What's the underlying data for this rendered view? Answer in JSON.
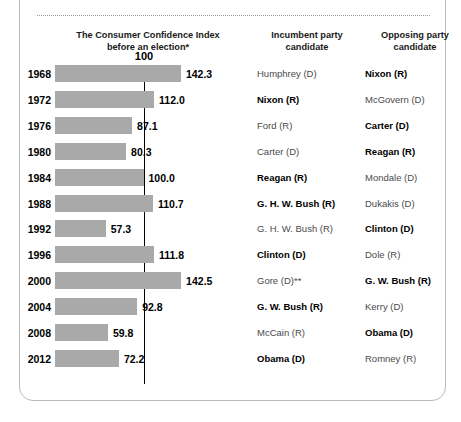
{
  "card": {
    "title": "Consumer Confidence"
  },
  "headers": {
    "chart": "The Consumer Confidence Index\nbefore an election*",
    "chart_line1": "The Consumer Confidence Index",
    "chart_line2": "before an election*",
    "incumbent_line1": "Incumbent party",
    "incumbent_line2": "candidate",
    "opposing_line1": "Opposing party",
    "opposing_line2": "candidate"
  },
  "axis": {
    "reference_label": "100",
    "reference_value": 100
  },
  "colors": {
    "bar": "#a9a9a9",
    "reference_line": "#000000",
    "card_border": "#b9b9b9",
    "winner_text": "#000000",
    "loser_text": "#4a4a4a"
  },
  "chart_data": {
    "type": "bar",
    "title": "The Consumer Confidence Index before an election*",
    "xlabel": "",
    "ylabel": "",
    "orientation": "horizontal",
    "xlim": [
      0,
      150
    ],
    "grid": false,
    "reference_line": 100,
    "legend": "none",
    "categories": [
      "1968",
      "1972",
      "1976",
      "1980",
      "1984",
      "1988",
      "1992",
      "1996",
      "2000",
      "2004",
      "2008",
      "2012"
    ],
    "values": [
      142.3,
      112.0,
      87.1,
      80.3,
      100.0,
      110.7,
      57.3,
      111.8,
      142.5,
      92.8,
      59.8,
      72.2
    ],
    "value_labels": [
      "142.3",
      "112.0",
      "87.1",
      "80.3",
      "100.0",
      "110.7",
      "57.3",
      "111.8",
      "142.5",
      "92.8",
      "59.8",
      "72.2"
    ]
  },
  "rows": [
    {
      "year": "1968",
      "value": 142.3,
      "label": "142.3",
      "incumbent": "Humphrey (D)",
      "incumbent_win": false,
      "opposing": "Nixon (R)",
      "opposing_win": true
    },
    {
      "year": "1972",
      "value": 112.0,
      "label": "112.0",
      "incumbent": "Nixon (R)",
      "incumbent_win": true,
      "opposing": "McGovern (D)",
      "opposing_win": false
    },
    {
      "year": "1976",
      "value": 87.1,
      "label": "87.1",
      "incumbent": "Ford (R)",
      "incumbent_win": false,
      "opposing": "Carter (D)",
      "opposing_win": true
    },
    {
      "year": "1980",
      "value": 80.3,
      "label": "80.3",
      "incumbent": "Carter (D)",
      "incumbent_win": false,
      "opposing": "Reagan (R)",
      "opposing_win": true
    },
    {
      "year": "1984",
      "value": 100.0,
      "label": "100.0",
      "incumbent": "Reagan (R)",
      "incumbent_win": true,
      "opposing": "Mondale (D)",
      "opposing_win": false
    },
    {
      "year": "1988",
      "value": 110.7,
      "label": "110.7",
      "incumbent": "G. H. W. Bush (R)",
      "incumbent_win": true,
      "opposing": "Dukakis (D)",
      "opposing_win": false
    },
    {
      "year": "1992",
      "value": 57.3,
      "label": "57.3",
      "incumbent": "G. H. W. Bush (R)",
      "incumbent_win": false,
      "opposing": "Clinton (D)",
      "opposing_win": true
    },
    {
      "year": "1996",
      "value": 111.8,
      "label": "111.8",
      "incumbent": "Clinton (D)",
      "incumbent_win": true,
      "opposing": "Dole (R)",
      "opposing_win": false
    },
    {
      "year": "2000",
      "value": 142.5,
      "label": "142.5",
      "incumbent": "Gore (D)**",
      "incumbent_win": false,
      "opposing": "G. W. Bush (R)",
      "opposing_win": true
    },
    {
      "year": "2004",
      "value": 92.8,
      "label": "92.8",
      "incumbent": "G. W. Bush (R)",
      "incumbent_win": true,
      "opposing": "Kerry (D)",
      "opposing_win": false
    },
    {
      "year": "2008",
      "value": 59.8,
      "label": "59.8",
      "incumbent": "McCain (R)",
      "incumbent_win": false,
      "opposing": "Obama (D)",
      "opposing_win": true
    },
    {
      "year": "2012",
      "value": 72.2,
      "label": "72.2",
      "incumbent": "Obama (D)",
      "incumbent_win": true,
      "opposing": "Romney (R)",
      "opposing_win": false
    }
  ]
}
